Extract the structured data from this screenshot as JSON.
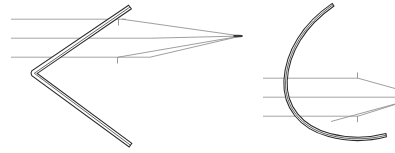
{
  "figure": {
    "background_color": "#ffffff",
    "width": 395,
    "height": 153,
    "stroke_color_mirror": "#2b2b2b",
    "stroke_color_ray": "#9a9a9a",
    "panels": [
      {
        "id": "left-panel",
        "name": "v-mirror-panel",
        "label": "V-shaped mirror",
        "mirror": {
          "type": "v-mirror",
          "name": "v-mirror-shape",
          "vertex": {
            "x": 33,
            "y": 73
          },
          "upper_tip": {
            "x": 129,
            "y": 6
          },
          "lower_tip": {
            "x": 131,
            "y": 146
          },
          "thickness": 3.4
        },
        "incoming_rays": [
          {
            "name": "incoming-ray-1",
            "x1": 11,
            "y1": 19,
            "x2": 126,
            "y2": 19
          },
          {
            "name": "incoming-ray-2",
            "x1": 11,
            "y1": 38,
            "x2": 150,
            "y2": 38
          },
          {
            "name": "incoming-ray-3",
            "x1": 11,
            "y1": 57,
            "x2": 150,
            "y2": 57
          }
        ],
        "reflected_rays": [
          {
            "name": "reflected-ray-1",
            "x1": 121,
            "y1": 19,
            "x2": 240,
            "y2": 36
          },
          {
            "name": "reflected-ray-2",
            "x1": 182,
            "y1": 29,
            "x2": 240,
            "y2": 36
          },
          {
            "name": "reflected-ray-3",
            "x1": 118,
            "y1": 57,
            "x2": 240,
            "y2": 36
          }
        ],
        "ticks": [
          {
            "name": "normal-tick-1",
            "x": 118,
            "y1": 19,
            "y2": 25
          },
          {
            "name": "normal-tick-2",
            "x": 117,
            "y1": 57,
            "y2": 63
          }
        ],
        "focus": {
          "name": "focal-point",
          "x": 240,
          "y": 36
        }
      },
      {
        "id": "right-panel",
        "name": "curved-mirror-panel",
        "label": "Curved (parabolic) mirror",
        "mirror": {
          "type": "curved-mirror",
          "name": "curved-mirror-shape",
          "top_tip": {
            "x": 334,
            "y": 7
          },
          "leftmost": {
            "x": 287,
            "y": 82
          },
          "bottom_tip": {
            "x": 386,
            "y": 136
          },
          "thickness": 3.2
        },
        "incoming_rays": [
          {
            "name": "incoming-ray-1",
            "x1": 263,
            "y1": 78,
            "x2": 357,
            "y2": 78
          },
          {
            "name": "incoming-ray-2",
            "x1": 263,
            "y1": 97,
            "x2": 395,
            "y2": 97
          },
          {
            "name": "incoming-ray-3",
            "x1": 263,
            "y1": 116,
            "x2": 357,
            "y2": 116
          }
        ],
        "reflected_rays": [
          {
            "name": "reflected-ray-1",
            "x1": 300,
            "y1": 78,
            "x2": 395,
            "y2": 90
          },
          {
            "name": "reflected-ray-2",
            "x1": 330,
            "y1": 120,
            "x2": 395,
            "y2": 106
          },
          {
            "name": "reflected-ray-3",
            "x1": 300,
            "y1": 116,
            "x2": 395,
            "y2": 103
          }
        ],
        "ticks": [
          {
            "name": "normal-tick-1",
            "x": 357,
            "y1": 73,
            "y2": 79
          },
          {
            "name": "normal-tick-2",
            "x": 357,
            "y1": 116,
            "y2": 122
          }
        ]
      }
    ]
  }
}
